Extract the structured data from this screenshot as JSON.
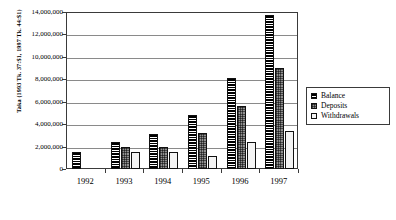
{
  "chart_data": {
    "type": "bar",
    "title": "",
    "xlabel": "",
    "ylabel": "Taka (1993 Tk. 37:$1, 1997 Tk. 44:$1)",
    "categories": [
      "1992",
      "1993",
      "1994",
      "1995",
      "1996",
      "1997"
    ],
    "series": [
      {
        "name": "Balance",
        "values": [
          1500000,
          2400000,
          3100000,
          4800000,
          8100000,
          13700000
        ]
      },
      {
        "name": "Deposits",
        "values": [
          0,
          2000000,
          2000000,
          3200000,
          5600000,
          9000000
        ]
      },
      {
        "name": "Withdrawals",
        "values": [
          0,
          1500000,
          1500000,
          1200000,
          2400000,
          3400000
        ]
      }
    ],
    "ylim": [
      0,
      14000000
    ],
    "ytick_values": [
      0,
      2000000,
      4000000,
      6000000,
      8000000,
      10000000,
      12000000,
      14000000
    ],
    "ytick_labels": [
      "0",
      "2,000,000",
      "4,000,000",
      "6,000,000",
      "8,000,000",
      "10,000,000",
      "12,000,000",
      "14,000,000"
    ],
    "grid": true,
    "legend_position": "right",
    "colors": {
      "balance": "#000000",
      "deposits": "#9a9a9a",
      "withdrawals": "#f4f4f4",
      "axis": "#3a3a3a",
      "gridline": "#8a8a8a",
      "background": "#ffffff"
    }
  },
  "legend": {
    "items": [
      {
        "label": "Balance",
        "swatch": "solid-black-hatch"
      },
      {
        "label": "Deposits",
        "swatch": "cross-hatch-gray"
      },
      {
        "label": "Withdrawals",
        "swatch": "empty-white"
      }
    ]
  }
}
